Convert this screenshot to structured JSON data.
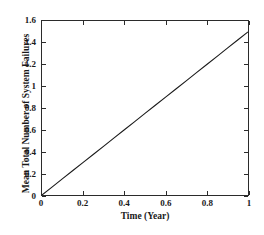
{
  "chart_data": {
    "type": "line",
    "title": "",
    "subtitle": "",
    "xlabel": "Time (Year)",
    "ylabel": "Mean Total Number of System Failures",
    "xlim": [
      0,
      1
    ],
    "ylim": [
      0,
      1.6
    ],
    "xticks": [
      0,
      0.2,
      0.4,
      0.6,
      0.8,
      1
    ],
    "xticklabels": [
      "0",
      "0.2",
      "0.4",
      "0.6",
      "0.8",
      "1"
    ],
    "yticks": [
      0,
      0.2,
      0.4,
      0.6,
      0.8,
      1,
      1.2,
      1.4,
      1.6
    ],
    "yticklabels": [
      "0",
      "0.2",
      "0.4",
      "0.6",
      "0.8",
      "1",
      "1.2",
      "1.4",
      "1.6"
    ],
    "grid": false,
    "legend": null,
    "legend_position": "none",
    "box": true,
    "tick_direction": "in",
    "line_color": "#1a1a1a",
    "background_color": "#ffffff",
    "axis_color": "#2b2b2b",
    "annotations": [],
    "series": [
      {
        "name": "Mean Total Number of System Failures",
        "color": "#1a1a1a",
        "style": "solid",
        "width": 1,
        "x": [
          0,
          0.05,
          0.1,
          0.15,
          0.2,
          0.25,
          0.3,
          0.35,
          0.4,
          0.45,
          0.5,
          0.55,
          0.6,
          0.65,
          0.7,
          0.75,
          0.8,
          0.85,
          0.9,
          0.95,
          1
        ],
        "values": [
          0,
          0.075,
          0.15,
          0.225,
          0.3,
          0.375,
          0.45,
          0.525,
          0.6,
          0.675,
          0.75,
          0.825,
          0.9,
          0.975,
          1.05,
          1.125,
          1.2,
          1.275,
          1.35,
          1.425,
          1.5
        ]
      }
    ]
  }
}
